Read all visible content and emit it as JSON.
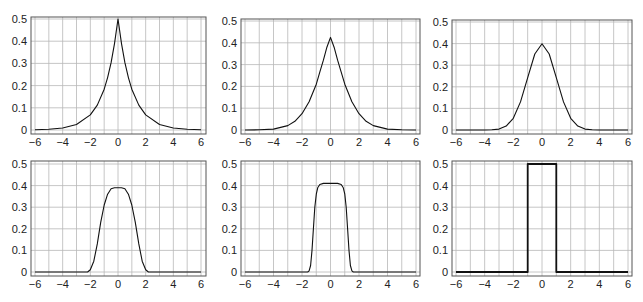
{
  "figure": {
    "grid_color": "#b8b8b8",
    "line_color": "#111111",
    "frame_color": "#555555"
  },
  "chart_data": [
    {
      "type": "line",
      "title": "",
      "xlabel": "",
      "ylabel": "",
      "xlim": [
        -6,
        6
      ],
      "ylim": [
        0,
        0.5
      ],
      "grid": true,
      "xticks": [
        "−6",
        "−4",
        "−2",
        "0",
        "2",
        "4",
        "6"
      ],
      "yticks": [
        "0",
        "0.1",
        "0.2",
        "0.3",
        "0.4",
        "0.5"
      ],
      "series": [
        {
          "name": "density",
          "peak": 0.5,
          "x": [
            -6,
            -5,
            -4,
            -3,
            -2,
            -1.5,
            -1,
            -0.75,
            -0.5,
            -0.25,
            0,
            0.25,
            0.5,
            0.75,
            1,
            1.5,
            2,
            3,
            4,
            5,
            6
          ],
          "y": [
            0.001,
            0.003,
            0.009,
            0.025,
            0.068,
            0.112,
            0.184,
            0.236,
            0.303,
            0.389,
            0.5,
            0.389,
            0.303,
            0.236,
            0.184,
            0.112,
            0.068,
            0.025,
            0.009,
            0.003,
            0.001
          ]
        }
      ]
    },
    {
      "type": "line",
      "title": "",
      "xlabel": "",
      "ylabel": "",
      "xlim": [
        -6,
        6
      ],
      "ylim": [
        0,
        0.5
      ],
      "grid": true,
      "xticks": [
        "−6",
        "−4",
        "−2",
        "0",
        "2",
        "4",
        "6"
      ],
      "yticks": [
        "0",
        "0.1",
        "0.2",
        "0.3",
        "0.4",
        "0.5"
      ],
      "series": [
        {
          "name": "density",
          "peak": 0.425,
          "x": [
            -6,
            -5,
            -4,
            -3,
            -2.5,
            -2,
            -1.5,
            -1,
            -0.75,
            -0.5,
            -0.25,
            0,
            0.25,
            0.5,
            0.75,
            1,
            1.5,
            2,
            2.5,
            3,
            4,
            5,
            6
          ],
          "y": [
            0,
            0.001,
            0.004,
            0.02,
            0.04,
            0.075,
            0.13,
            0.21,
            0.265,
            0.32,
            0.38,
            0.425,
            0.38,
            0.32,
            0.265,
            0.21,
            0.13,
            0.075,
            0.04,
            0.02,
            0.004,
            0.001,
            0
          ]
        }
      ]
    },
    {
      "type": "line",
      "title": "",
      "xlabel": "",
      "ylabel": "",
      "xlim": [
        -6,
        6
      ],
      "ylim": [
        0,
        0.5
      ],
      "grid": true,
      "xticks": [
        "−6",
        "−4",
        "−2",
        "0",
        "2",
        "4",
        "6"
      ],
      "yticks": [
        "0",
        "0.1",
        "0.2",
        "0.3",
        "0.4",
        "0.5"
      ],
      "series": [
        {
          "name": "density",
          "peak": 0.399,
          "x": [
            -6,
            -4,
            -3.5,
            -3,
            -2.5,
            -2,
            -1.5,
            -1,
            -0.5,
            0,
            0.5,
            1,
            1.5,
            2,
            2.5,
            3,
            3.5,
            4,
            6
          ],
          "y": [
            0,
            0,
            0.001,
            0.004,
            0.018,
            0.054,
            0.13,
            0.242,
            0.352,
            0.399,
            0.352,
            0.242,
            0.13,
            0.054,
            0.018,
            0.004,
            0.001,
            0,
            0
          ]
        }
      ]
    },
    {
      "type": "line",
      "title": "",
      "xlabel": "",
      "ylabel": "",
      "xlim": [
        -6,
        6
      ],
      "ylim": [
        0,
        0.5
      ],
      "grid": true,
      "xticks": [
        "−6",
        "−4",
        "−2",
        "0",
        "2",
        "4",
        "6"
      ],
      "yticks": [
        "0",
        "0.1",
        "0.2",
        "0.3",
        "0.4",
        "0.5"
      ],
      "series": [
        {
          "name": "density",
          "peak": 0.39,
          "x": [
            -6,
            -2.2,
            -2,
            -1.75,
            -1.5,
            -1.25,
            -1,
            -0.75,
            -0.5,
            -0.25,
            0,
            0.25,
            0.5,
            0.75,
            1,
            1.25,
            1.5,
            1.75,
            2,
            2.2,
            6
          ],
          "y": [
            0,
            0,
            0.01,
            0.05,
            0.13,
            0.23,
            0.31,
            0.36,
            0.385,
            0.39,
            0.39,
            0.39,
            0.385,
            0.36,
            0.31,
            0.23,
            0.13,
            0.05,
            0.01,
            0,
            0
          ]
        }
      ]
    },
    {
      "type": "line",
      "title": "",
      "xlabel": "",
      "ylabel": "",
      "xlim": [
        -6,
        6
      ],
      "ylim": [
        0,
        0.5
      ],
      "grid": true,
      "xticks": [
        "−6",
        "−4",
        "−2",
        "0",
        "2",
        "4",
        "6"
      ],
      "yticks": [
        "0",
        "0.1",
        "0.2",
        "0.3",
        "0.4",
        "0.5"
      ],
      "series": [
        {
          "name": "density",
          "peak": 0.41,
          "x": [
            -6,
            -1.6,
            -1.5,
            -1.4,
            -1.3,
            -1.2,
            -1.1,
            -1,
            -0.9,
            -0.75,
            -0.5,
            0,
            0.5,
            0.75,
            0.9,
            1,
            1.1,
            1.2,
            1.3,
            1.4,
            1.5,
            1.6,
            6
          ],
          "y": [
            0,
            0,
            0.005,
            0.03,
            0.1,
            0.2,
            0.3,
            0.36,
            0.39,
            0.405,
            0.41,
            0.41,
            0.41,
            0.405,
            0.39,
            0.36,
            0.3,
            0.2,
            0.1,
            0.03,
            0.005,
            0,
            0
          ]
        }
      ]
    },
    {
      "type": "line",
      "title": "",
      "xlabel": "",
      "ylabel": "",
      "xlim": [
        -6,
        6
      ],
      "ylim": [
        0,
        0.5
      ],
      "grid": true,
      "xticks": [
        "−6",
        "−4",
        "−2",
        "0",
        "2",
        "4",
        "6"
      ],
      "yticks": [
        "0",
        "0.1",
        "0.2",
        "0.3",
        "0.4",
        "0.5"
      ],
      "series": [
        {
          "name": "density",
          "peak": 0.5,
          "x": [
            -6,
            -1,
            -1,
            1,
            1,
            6
          ],
          "y": [
            0,
            0,
            0.5,
            0.5,
            0,
            0
          ]
        }
      ]
    }
  ]
}
